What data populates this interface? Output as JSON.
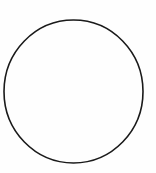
{
  "diagram": {
    "shapes": [
      {
        "type": "ellipse",
        "cx": 73.5,
        "cy": 91.5,
        "rx": 69.5,
        "ry": 71.5,
        "stroke": "#1a1a1a",
        "stroke_width": 1.6,
        "fill": "none"
      }
    ],
    "background": "#fefefe"
  }
}
